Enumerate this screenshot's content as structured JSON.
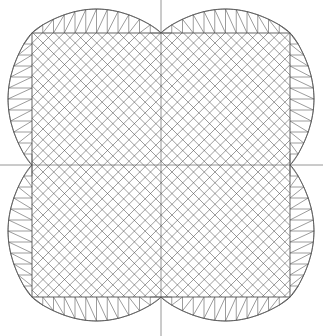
{
  "figure": {
    "title": "",
    "background_color": "#ffffff",
    "width": 323,
    "height": 336
  },
  "chart_data": {
    "type": "diagram",
    "subtype": "finite-element-mesh",
    "title": "",
    "subtitle": "",
    "xlabel": "",
    "ylabel": "",
    "grid": false,
    "legend": null,
    "annotations": [],
    "tick_labels": {
      "x": [],
      "y": []
    },
    "axis_lines": {
      "color": "#8a8a8a",
      "stroke_width": 0.9,
      "horizontal": {
        "y": 165,
        "x_start": 0,
        "x_end": 323
      },
      "vertical": {
        "x": 161,
        "y_start": 0,
        "y_end": 336
      }
    },
    "domain_shape": {
      "name": "four-cusp-squircle",
      "description": "square-like region whose four sides bow outward and dip to an inward cusp at each edge midpoint",
      "center": [
        161,
        165
      ],
      "cusp_points": [
        {
          "label": "top",
          "x": 161,
          "y": 33
        },
        {
          "label": "right",
          "x": 290,
          "y": 165
        },
        {
          "label": "bottom",
          "x": 161,
          "y": 297
        },
        {
          "label": "left",
          "x": 32,
          "y": 165
        }
      ],
      "corner_points": [
        {
          "label": "top-left",
          "x": 32,
          "y": 33
        },
        {
          "label": "top-right",
          "x": 290,
          "y": 33
        },
        {
          "label": "bottom-right",
          "x": 290,
          "y": 297
        },
        {
          "label": "bottom-left",
          "x": 32,
          "y": 297
        }
      ],
      "extreme_points": [
        {
          "label": "top-left-bulge",
          "x": 80,
          "y": 15
        },
        {
          "label": "top-right-bulge",
          "x": 242,
          "y": 15
        },
        {
          "label": "right-top-bulge",
          "x": 314,
          "y": 85
        },
        {
          "label": "right-bottom-bulge",
          "x": 314,
          "y": 247
        },
        {
          "label": "bottom-right-bulge",
          "x": 242,
          "y": 319
        },
        {
          "label": "bottom-left-bulge",
          "x": 80,
          "y": 319
        },
        {
          "label": "left-bottom-bulge",
          "x": 8,
          "y": 247
        },
        {
          "label": "left-top-bulge",
          "x": 8,
          "y": 85
        }
      ],
      "bulge_depth_px": 24,
      "outer_stroke_color": "#555555"
    },
    "inner_core": {
      "shape": "rectangle",
      "x_min": 32,
      "x_max": 290,
      "y_min": 33,
      "y_max": 297,
      "element_type": "rotated-quadrilateral",
      "rotation_deg": 45,
      "grid_pitch_px": 10.75,
      "divisions_x": 24,
      "divisions_y": 24,
      "stroke_color": "#4a4a4a"
    },
    "boundary_layer": {
      "element_type": "triangle",
      "description": "triangular strip between each straight inner-core edge and the curved outer boundary",
      "segments_per_half_edge": 12,
      "stroke_color": "#4a4a4a"
    }
  },
  "meta": {
    "line_colors": {
      "axis": "#8a8a8a",
      "boundary": "#555555",
      "mesh": "#4a4a4a"
    }
  }
}
